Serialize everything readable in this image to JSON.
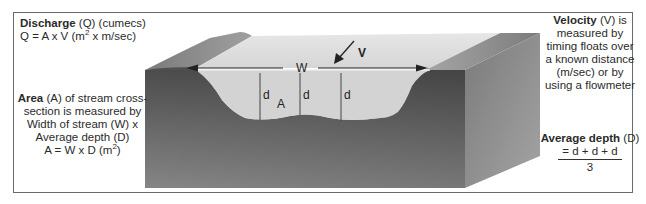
{
  "diagram": {
    "labels": {
      "discharge": {
        "heading_bold": "Discharge",
        "heading_rest": " (Q) (cumecs)",
        "formula_prefix": "Q = A x V (m",
        "formula_sup": "2",
        "formula_suffix": " x m/sec)"
      },
      "area": {
        "heading_bold": "Area",
        "line1_rest": " (A) of stream cross-",
        "line2": "section is measured by",
        "line3": "Width of stream (W) x",
        "line4": "Average depth (D)",
        "formula_prefix": "A = W x D (m",
        "formula_sup": "2",
        "formula_suffix": ")"
      },
      "velocity": {
        "heading_bold": "Velocity",
        "line1_rest": " (V) is",
        "line2": "measured by",
        "line3": "timing floats over",
        "line4": "a known distance",
        "line5": "(m/sec) or by",
        "line6": "using a flowmeter"
      },
      "average_depth": {
        "heading_bold": "Average depth",
        "heading_rest": " (D)",
        "numerator": "= d + d + d",
        "denominator": "3"
      }
    },
    "channel_labels": {
      "width": "W",
      "velocity": "V",
      "area": "A",
      "depths": [
        "d",
        "d",
        "d"
      ]
    },
    "colors": {
      "frame": "#6a6a6a",
      "block_dark": "#5e5e5e",
      "block_light": "#9a9a9a",
      "side_face": "#8a8a8a",
      "water_surface": "#dcdcdc",
      "water_cross_section": "#d2d2d2",
      "text": "#2b2b2b"
    }
  }
}
